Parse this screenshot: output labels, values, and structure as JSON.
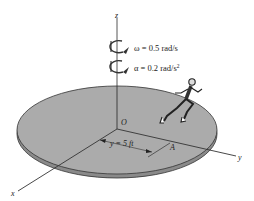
{
  "diagram": {
    "axes": {
      "z_label": "z",
      "x_label": "x",
      "y_label": "y",
      "origin_label": "O"
    },
    "angular_velocity": {
      "symbol": "ω",
      "text": "ω = 0.5 rad/s",
      "value": 0.5,
      "unit": "rad/s"
    },
    "angular_acceleration": {
      "symbol": "α",
      "text_main": "α = 0.2 rad/s",
      "superscript": "2",
      "value": 0.2,
      "unit": "rad/s²"
    },
    "dimension": {
      "text": "y = 5 ft",
      "value": 5,
      "unit": "ft"
    },
    "point_label": "A",
    "colors": {
      "disk_top": "#a8a8a8",
      "disk_edge": "#7a7a7a",
      "lines": "#333333",
      "background": "#ffffff"
    }
  }
}
